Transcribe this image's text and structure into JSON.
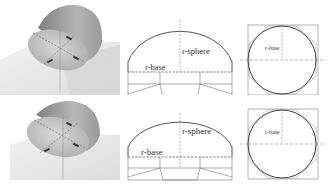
{
  "rows": [
    {
      "render": {
        "description": "3D render of truncated sphere (dome) with cut-away base"
      },
      "profile": {
        "label_sphere": "r-sphere",
        "label_base": "r-base"
      },
      "plan": {
        "label_base": "r-base"
      }
    },
    {
      "render": {
        "description": "3D render of truncated sphere (dome), variant 2"
      },
      "profile": {
        "label_sphere": "r-sphere",
        "label_base": "r-base"
      },
      "plan": {
        "label_base": "r-base"
      }
    }
  ],
  "colors": {
    "line": "#555555",
    "dashed": "#888888",
    "square": "#a0a0a0",
    "dome_dark": "#8a8a8a",
    "dome_light": "#c8c8c8",
    "ground": "#e6e6e6"
  }
}
